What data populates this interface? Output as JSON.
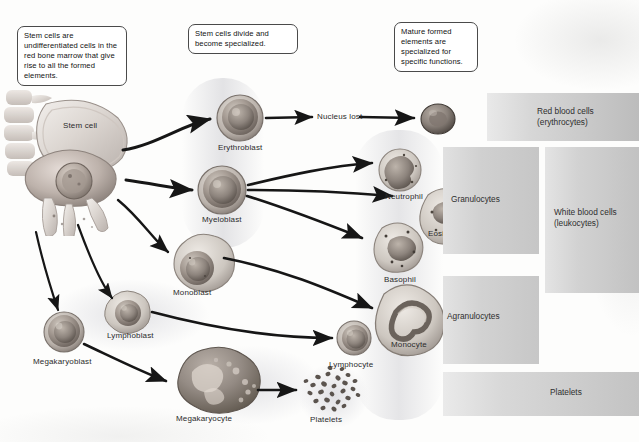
{
  "figure": {
    "type": "biology-flow-diagram"
  },
  "callouts": [
    {
      "id": "callout-stem-cells",
      "text": "Stem cells are undifferentiated cells in the red bone marrow that give rise to all the formed elements."
    },
    {
      "id": "callout-divide",
      "text": "Stem cells divide and become specialized."
    },
    {
      "id": "callout-mature",
      "text": "Mature formed elements are specialized for specific functions."
    }
  ],
  "labels": {
    "stem_cell": "Stem cell",
    "erythroblast": "Erythroblast",
    "myeloblast": "Myeloblast",
    "monoblast": "Monoblast",
    "lymphoblast": "Lymphoblast",
    "megakaryoblast": "Megakaryoblast",
    "megakaryocyte": "Megakaryocyte",
    "nucleus_lost": "Nucleus lost",
    "neutrophil": "Neutrophil",
    "eosinophil": "Eosinophil",
    "basophil": "Basophil",
    "monocyte": "Monocyte",
    "lymphocyte": "Lymphocyte",
    "platelets": "Platelets"
  },
  "categories": [
    {
      "id": "red-blood-cells",
      "text": "Red blood cells (erythrocytes)"
    },
    {
      "id": "white-blood-cells",
      "text": "White blood cells (leukocytes)"
    },
    {
      "id": "granulocytes",
      "text": "Granulocytes"
    },
    {
      "id": "agranulocytes",
      "text": "Agranulocytes"
    },
    {
      "id": "platelets",
      "text": "Platelets"
    }
  ],
  "colors": {
    "background": "#fdfdfc",
    "callout_border": "#4a4a4a",
    "text": "#2b2b2b",
    "arrow": "#1c1c1c",
    "band": "#dedee1",
    "catbar_light": "#e9e9e9",
    "catbar_dark": "#bcbcbc"
  }
}
